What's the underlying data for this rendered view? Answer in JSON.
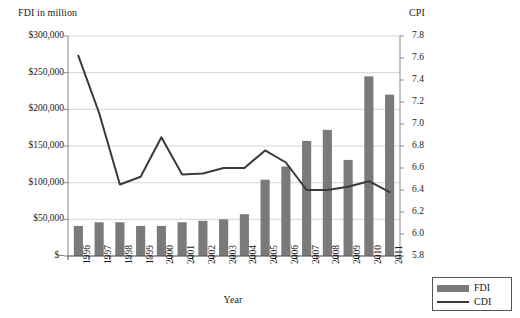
{
  "chart_data": {
    "type": "bar",
    "title": "",
    "categories": [
      "1996",
      "1997",
      "1998",
      "1999",
      "2000",
      "2001",
      "2002",
      "2003",
      "2004",
      "2005",
      "2006",
      "2007",
      "2008",
      "2009",
      "2010",
      "2011"
    ],
    "xlabel": "Year",
    "ylabel": "FDI in million",
    "y2label": "CPI",
    "ylim": [
      0,
      300000
    ],
    "y2lim": [
      5.8,
      7.8
    ],
    "grid": true,
    "legend_position": "bottom-right",
    "y_ticks": [
      "$–",
      "$50,000",
      "$100,000",
      "$150,000",
      "$200,000",
      "$250,000",
      "$300,000"
    ],
    "y_tick_values": [
      0,
      50000,
      100000,
      150000,
      200000,
      250000,
      300000
    ],
    "y2_ticks": [
      "5.8",
      "6.0",
      "6.2",
      "6.4",
      "6.6",
      "6.8",
      "7.0",
      "7.2",
      "7.4",
      "7.6",
      "7.8"
    ],
    "y2_tick_values": [
      5.8,
      6.0,
      6.2,
      6.4,
      6.6,
      6.8,
      7.0,
      7.2,
      7.4,
      7.6,
      7.8
    ],
    "series": [
      {
        "name": "FDI",
        "type": "bar",
        "axis": "left",
        "color": "#7a7a7a",
        "values": [
          41000,
          46000,
          46000,
          41000,
          41000,
          46000,
          48000,
          50000,
          57000,
          104000,
          122000,
          157000,
          172000,
          131000,
          245000,
          220000
        ]
      },
      {
        "name": "CDI",
        "type": "line",
        "axis": "right",
        "color": "#3a3a3a",
        "values": [
          7.62,
          7.1,
          6.45,
          6.52,
          6.88,
          6.54,
          6.55,
          6.6,
          6.6,
          6.76,
          6.65,
          6.4,
          6.4,
          6.43,
          6.48,
          6.38
        ]
      }
    ],
    "legend": [
      {
        "label": "FDI",
        "marker": "bar",
        "color": "#7a7a7a"
      },
      {
        "label": "CDI",
        "marker": "line",
        "color": "#3a3a3a"
      }
    ]
  }
}
